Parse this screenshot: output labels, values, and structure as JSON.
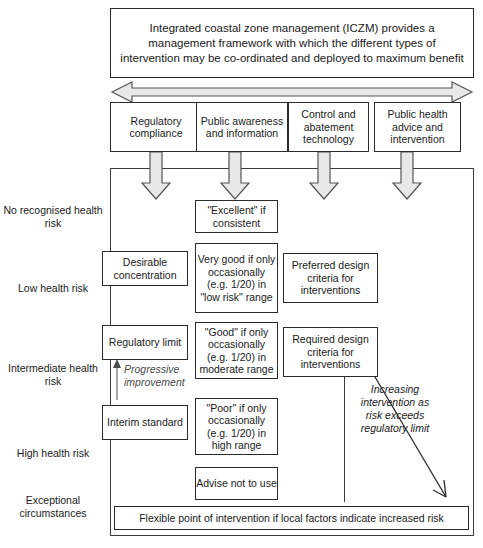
{
  "diagram": {
    "header": {
      "text": "Integrated coastal zone management (ICZM) provides a management framework with which the different types of intervention may be co-ordinated and deployed to maximum benefit"
    },
    "span_arrow": {
      "name": "double-headed-span-arrow"
    },
    "intervention_types": [
      {
        "label": "Regulatory compliance"
      },
      {
        "label": "Public awareness and information"
      },
      {
        "label": "Control and abatement technology"
      },
      {
        "label": "Public health advice and intervention"
      }
    ],
    "risk_levels": [
      {
        "label": "No recognised health risk"
      },
      {
        "label": "Low health risk"
      },
      {
        "label": "Intermediate health risk"
      },
      {
        "label": "High health risk"
      },
      {
        "label": "Exceptional circumstances"
      }
    ],
    "standards_column": [
      {
        "label": "Desirable concentration"
      },
      {
        "label": "Regulatory limit"
      },
      {
        "label": "Interim standard"
      }
    ],
    "quality_column": [
      {
        "label": "\"Excellent\" if consistent"
      },
      {
        "label": "Very good if only occasionally (e.g. 1/20) in \"low risk\" range"
      },
      {
        "label": "\"Good\" if only occasionally (e.g. 1/20) in moderate range"
      },
      {
        "label": "\"Poor\" if only occasionally (e.g. 1/20) in high range"
      },
      {
        "label": "Advise not to use"
      }
    ],
    "design_criteria_column": [
      {
        "label": "Preferred design criteria for interventions"
      },
      {
        "label": "Required design criteria for interventions"
      }
    ],
    "annotations": {
      "progressive_improvement": "Progressive improvement",
      "increasing_intervention": "Increasing intervention as risk exceeds regulatory limit"
    },
    "footer": {
      "text": "Flexible point of intervention if local factors indicate increased risk"
    },
    "colors": {
      "line": "#2b2b2b",
      "arrow_fill": "#e8e8e8",
      "arrow_stroke": "#555555",
      "thin_arrow": "#7a7a7a",
      "text": "#1a1a1a"
    }
  }
}
